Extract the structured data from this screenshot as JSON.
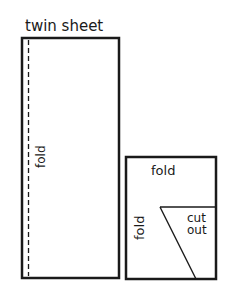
{
  "diagram": {
    "title": "twin sheet",
    "large_sheet": {
      "label": "twin sheet",
      "fold_label": "fold",
      "fold_line": "dashed"
    },
    "folded_piece": {
      "top_fold_label": "fold",
      "side_fold_label": "fold",
      "cutout_label_line1": "cut",
      "cutout_label_line2": "out"
    },
    "colors": {
      "stroke": "#1a1a1a",
      "background": "#ffffff"
    }
  }
}
